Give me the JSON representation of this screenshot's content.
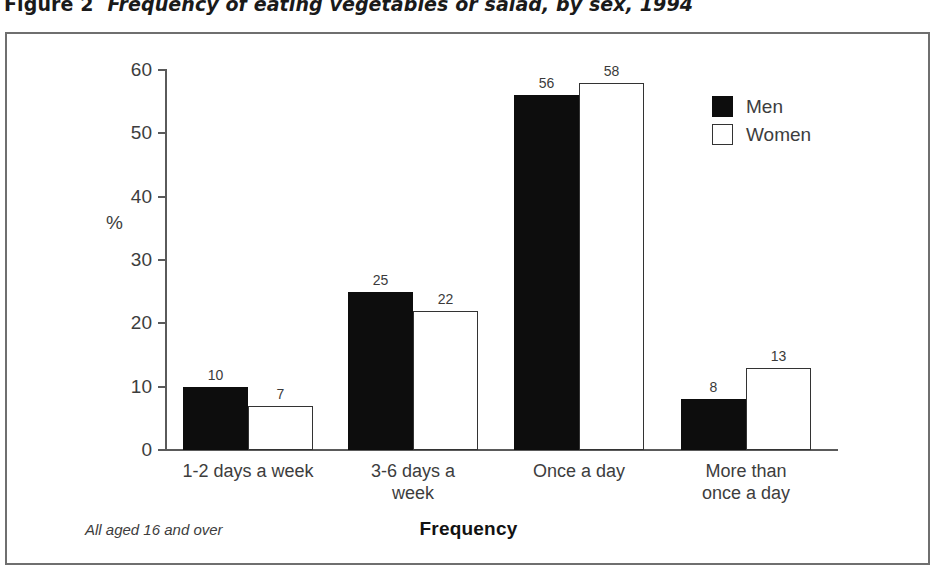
{
  "figure": {
    "number": "Figure 2",
    "title": "Frequency of eating vegetables or salad, by sex, 1994",
    "footnote": "All aged 16 and over"
  },
  "colors": {
    "men": "#0d0d0d",
    "women": "#ffffff",
    "women_outline": "#333333",
    "axis": "#5a5a5a",
    "frame": "#6f6f6f",
    "text": "#3d3d3d",
    "background": "#ffffff"
  },
  "legend": {
    "position": "top-right",
    "entries": [
      {
        "label": "Men",
        "swatch": "filled-black-square"
      },
      {
        "label": "Women",
        "swatch": "outlined-white-square"
      }
    ]
  },
  "axes": {
    "y_unit_label": "%",
    "y_ticks": [
      "0",
      "10",
      "20",
      "30",
      "40",
      "50",
      "60"
    ],
    "x_title": "Frequency"
  },
  "chart_data": {
    "type": "bar",
    "title": "Frequency of eating vegetables or salad, by sex, 1994",
    "xlabel": "Frequency",
    "ylabel": "%",
    "ylim": [
      0,
      60
    ],
    "yticks": [
      0,
      10,
      20,
      30,
      40,
      50,
      60
    ],
    "grid": false,
    "legend_position": "top-right",
    "categories": [
      "1-2 days a week",
      "3-6 days a\nweek",
      "Once a day",
      "More than\nonce a day"
    ],
    "series": [
      {
        "name": "Men",
        "values": [
          10,
          25,
          56,
          8
        ]
      },
      {
        "name": "Women",
        "values": [
          7,
          22,
          58,
          13
        ]
      }
    ],
    "data_labels": true,
    "annotations": [
      "All aged 16 and over"
    ]
  }
}
